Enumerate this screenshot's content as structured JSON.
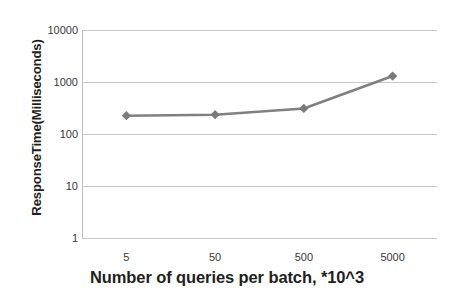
{
  "chart_data": {
    "type": "line",
    "title": "",
    "xlabel": "Number of queries per batch, *10^3",
    "ylabel": "ResponseTime(Milliseconds)",
    "categories": [
      "5",
      "50",
      "500",
      "5000"
    ],
    "values": [
      225,
      235,
      310,
      1300
    ],
    "series": [
      {
        "name": "Response time",
        "values": [
          225,
          235,
          310,
          1300
        ],
        "color": "#808080",
        "marker": "diamond"
      }
    ],
    "yscale": "log",
    "ylim": [
      1,
      10000
    ],
    "yticks": [
      "10000",
      "1000",
      "100",
      "10",
      "1"
    ],
    "ytick_values": [
      10000,
      1000,
      100,
      10,
      1
    ],
    "xticks": [
      "5",
      "50",
      "500",
      "5000"
    ],
    "grid": true,
    "grid_axis": "y",
    "grid_color": "#c9c9c9",
    "legend": false,
    "legend_position": "none",
    "background": "#ffffff",
    "line_color": "#808080",
    "marker_color": "#7a7a7a"
  }
}
